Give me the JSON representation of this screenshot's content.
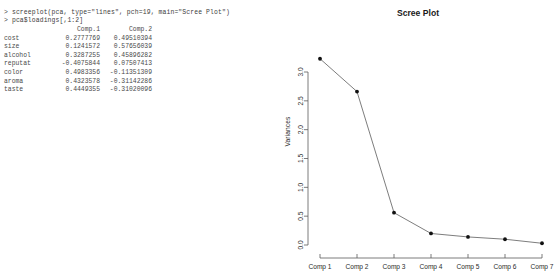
{
  "console": {
    "commands": [
      "> screeplot(pca, type=\"lines\", pch=19, main=\"Scree Plot\")",
      "> pca$loadings[,1:2]"
    ],
    "table": {
      "rowname_header": "",
      "columns": [
        "Comp.1",
        "Comp.2"
      ],
      "rows": [
        {
          "name": "cost",
          "comp1": " 0.2777769",
          "comp2": " 0.49510394"
        },
        {
          "name": "size",
          "comp1": " 0.1241572",
          "comp2": " 0.57656039"
        },
        {
          "name": "alcohol",
          "comp1": " 0.3287255",
          "comp2": " 0.45896282"
        },
        {
          "name": "reputat",
          "comp1": "-0.4075844",
          "comp2": " 0.07507413"
        },
        {
          "name": "color",
          "comp1": " 0.4983356",
          "comp2": "-0.11351309"
        },
        {
          "name": "aroma",
          "comp1": " 0.4323578",
          "comp2": "-0.31142286"
        },
        {
          "name": "taste",
          "comp1": " 0.4449355",
          "comp2": "-0.31020096"
        }
      ]
    }
  },
  "chart_data": {
    "type": "line",
    "title": "Scree Plot",
    "xlabel": "",
    "ylabel": "Variances",
    "categories": [
      "Comp 1",
      "Comp 2",
      "Comp 3",
      "Comp 4",
      "Comp 5",
      "Comp 6",
      "Comp 7"
    ],
    "values": [
      3.23,
      2.66,
      0.56,
      0.2,
      0.14,
      0.1,
      0.03
    ],
    "yticks": [
      "0.0",
      "0.5",
      "1.0",
      "1.5",
      "2.0",
      "2.5",
      "3.0"
    ],
    "ytick_values": [
      0.0,
      0.5,
      1.0,
      1.5,
      2.0,
      2.5,
      3.0
    ],
    "ylim": [
      0.0,
      3.0
    ],
    "grid": false,
    "legend": "none",
    "marker": "filled-circle",
    "line_color": "#6e6e6e",
    "point_color": "#111111"
  }
}
